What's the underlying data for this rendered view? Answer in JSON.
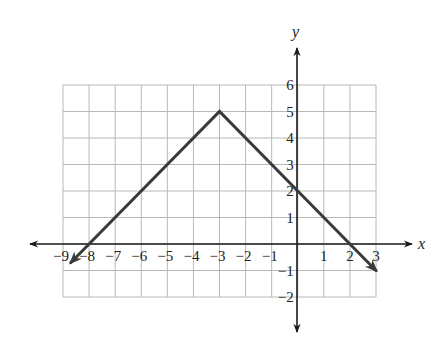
{
  "chart_data": {
    "type": "line",
    "title": "",
    "xlabel": "x",
    "ylabel": "y",
    "xlim": [
      -9,
      3
    ],
    "ylim": [
      -2,
      6
    ],
    "grid": true,
    "x_ticks": [
      "−9",
      "−8",
      "−7",
      "−6",
      "−5",
      "−4",
      "−3",
      "−2",
      "−1",
      "1",
      "2",
      "3"
    ],
    "x_tick_values": [
      -9,
      -8,
      -7,
      -6,
      -5,
      -4,
      -3,
      -2,
      -1,
      1,
      2,
      3
    ],
    "y_ticks": [
      "6",
      "5",
      "4",
      "3",
      "2",
      "1",
      "−1",
      "−2"
    ],
    "y_tick_values": [
      6,
      5,
      4,
      3,
      2,
      1,
      -1,
      -2
    ],
    "series": [
      {
        "name": "y = -|x + 3| + 5",
        "x": [
          -8.7,
          -8,
          -3,
          0,
          2,
          3
        ],
        "y": [
          -0.7,
          0,
          5,
          2,
          0,
          -1
        ],
        "color": "#3a3a3a",
        "arrows_at_ends": true
      }
    ],
    "key_points": {
      "vertex": [
        -3,
        5
      ],
      "y_intercept": [
        0,
        2
      ],
      "x_intercepts": [
        [
          -8,
          0
        ],
        [
          2,
          0
        ]
      ]
    }
  },
  "labels": {
    "x_axis": "x",
    "y_axis": "y"
  }
}
